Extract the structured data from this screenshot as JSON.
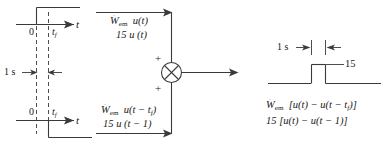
{
  "diagram": {
    "stroke_color": "#3a3a3a",
    "text_color": "#1a1a1a"
  },
  "left_graph_top": {
    "axis_label": "t",
    "origin_label": "0",
    "tf_label_base": "t",
    "tf_label_sub": "f",
    "description": "unit step rising at t = 0"
  },
  "left_graph_bottom": {
    "axis_label": "t",
    "origin_label": "0",
    "tf_label_base": "t",
    "tf_label_sub": "f",
    "description": "negative unit step dropping at t = t_f"
  },
  "interval_marker": {
    "label": "1 s"
  },
  "signal_top": {
    "line1_base": "W",
    "line1_dot": "˙",
    "line1_sub": "em",
    "line1_rest": "u(t)",
    "line2": "15 u (t)"
  },
  "signal_bottom": {
    "line1_base": "W",
    "line1_dot": "˙",
    "line1_sub": "em",
    "line1_rest_pre": "u(t − t",
    "line1_rest_sub": "f",
    "line1_rest_post": ")",
    "line2": "15 u (t − 1)"
  },
  "summing_junction": {
    "symbol": "⊗",
    "plus_top": "+",
    "plus_bottom": "+"
  },
  "output_plot": {
    "width_label": "1 s",
    "amplitude_label": "15"
  },
  "output_equation": {
    "line1_base": "W",
    "line1_dot": "˙",
    "line1_sub": "em",
    "line1_rest_pre": "[u(t) − u(t − t",
    "line1_rest_sub": "f",
    "line1_rest_post": ")]",
    "line2": "15 [u(t) − u(t − 1)]"
  }
}
